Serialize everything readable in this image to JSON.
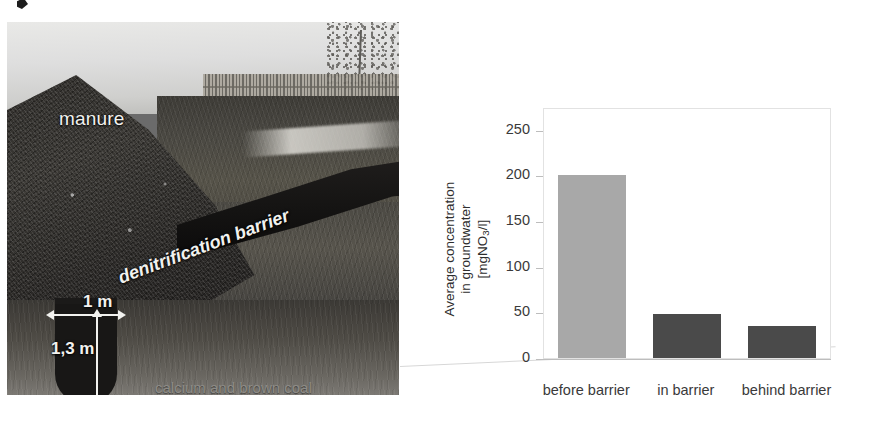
{
  "figure": {
    "photo": {
      "alt_name": "denitrification-barrier-cross-section-photo",
      "labels": {
        "manure": "manure",
        "barrier": "denitrification barrier",
        "width_dim": "1 m",
        "depth_dim": "1,3 m",
        "fill_material": "calcium and brown coal"
      }
    }
  },
  "chart_data": {
    "type": "bar",
    "title": "",
    "xlabel": "",
    "ylabel": "Average concentration in groundwater [mgNO3/l]",
    "ylabel_lines": [
      "Average concentration",
      "in groundwater",
      "[mgNO",
      "3",
      "/l]"
    ],
    "ylabel_line1": "Average concentration",
    "ylabel_line2": "in groundwater",
    "ylabel_line3_pre": "[mgNO",
    "ylabel_line3_sub": "3",
    "ylabel_line3_post": "/l]",
    "categories": [
      "before barrier",
      "in barrier",
      "behind barrier"
    ],
    "values": [
      201,
      48,
      35
    ],
    "ylim": [
      0,
      275
    ],
    "yticks": [
      0,
      50,
      100,
      150,
      200,
      250
    ],
    "ytick_labels": [
      "0",
      "50",
      "100",
      "150",
      "200",
      "250"
    ],
    "grid": false,
    "legend": "none",
    "bar_colors": [
      "#a8a8a8",
      "#4a4a4a",
      "#4a4a4a"
    ]
  },
  "colors": {
    "bar_light": "#a8a8a8",
    "bar_dark": "#4a4a4a",
    "axis": "#bdbdbd",
    "frame": "#e2e2e2",
    "text": "#3a3a3a",
    "label_light": "#f2f2ef",
    "label_muted": "#8e8c87",
    "background": "#ffffff"
  }
}
